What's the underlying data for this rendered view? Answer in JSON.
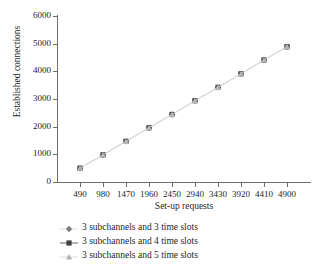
{
  "chart_data": {
    "type": "line",
    "title": "",
    "xlabel": "Set-up requests",
    "ylabel": "Established connections",
    "x": [
      490,
      980,
      1470,
      1960,
      2450,
      2940,
      3430,
      3920,
      4410,
      4900
    ],
    "xtick_labels": [
      "490",
      "980",
      "1470",
      "1960",
      "2450",
      "2940",
      "3430",
      "3920",
      "4410",
      "4900"
    ],
    "ytick_labels": [
      "0",
      "1000",
      "2000",
      "3000",
      "4000",
      "5000",
      "6000"
    ],
    "ytick_values": [
      0,
      1000,
      2000,
      3000,
      4000,
      5000,
      6000
    ],
    "ylim": [
      0,
      6000
    ],
    "grid": false,
    "legend_position": "below",
    "series": [
      {
        "name": "3 subchannels and 3 time slots",
        "marker": "diamond",
        "color": "#7f7f7f",
        "values": [
          500,
          980,
          1470,
          1960,
          2440,
          2940,
          3420,
          3910,
          4410,
          4890
        ]
      },
      {
        "name": "3 subchannels and 4 time slots",
        "marker": "square",
        "color": "#3f3f3f",
        "values": [
          500,
          980,
          1470,
          1960,
          2440,
          2940,
          3420,
          3910,
          4410,
          4890
        ]
      },
      {
        "name": "3 subchannels and 5 time slots",
        "marker": "triangle",
        "color": "#b5b5b5",
        "values": [
          500,
          980,
          1470,
          1960,
          2440,
          2940,
          3420,
          3910,
          4410,
          4890
        ]
      }
    ]
  },
  "legend": {
    "items": [
      {
        "label": "3 subchannels and 3 time slots"
      },
      {
        "label": "3 subchannels and 4 time slots"
      },
      {
        "label": "3 subchannels and 5 time slots"
      }
    ]
  },
  "colors": {
    "axis": "#6e6c6c",
    "text": "#221f1f",
    "series_1": "#7f7f7f",
    "series_2": "#3f3f3f",
    "series_3": "#b5b5b5",
    "line": "#d8d8d8"
  }
}
